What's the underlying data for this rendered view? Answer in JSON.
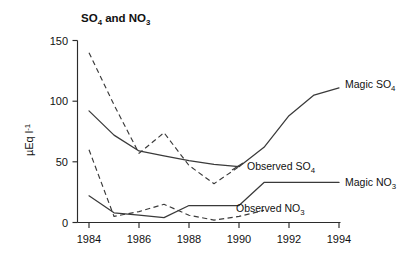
{
  "figure": {
    "title_main": "SO",
    "title_sub1": "4",
    "title_mid": " and NO",
    "title_sub2": "3",
    "title_plain": "SO4 and NO3",
    "background_color": "#ffffff",
    "ink_color": "#3a3a3a"
  },
  "axes": {
    "y_label_main": "µEq l",
    "y_label_sup": "-1",
    "y_label_plain": "µEq l-1",
    "y_ticks": [
      "0",
      "50",
      "100",
      "150"
    ],
    "y_tick_values": [
      0,
      50,
      100,
      150
    ],
    "x_ticks": [
      "1984",
      "1986",
      "1988",
      "1990",
      "1992",
      "1994"
    ],
    "x_tick_values": [
      1984,
      1986,
      1988,
      1990,
      1992,
      1994
    ],
    "x_label": ""
  },
  "series_labels": {
    "magic_so4": {
      "text": "Magic SO",
      "sub": "4",
      "plain": "Magic SO4"
    },
    "observed_so4": {
      "text": "Observed SO",
      "sub": "4",
      "plain": "Observed SO4"
    },
    "magic_no3": {
      "text": "Magic NO",
      "sub": "3",
      "plain": "Magic NO3"
    },
    "observed_no3": {
      "text": "Observed NO",
      "sub": "3",
      "plain": "Observed NO3"
    }
  },
  "chart_data": {
    "type": "line",
    "title": "SO4 and NO3",
    "xlabel": "",
    "ylabel": "µEq l-1",
    "xlim": [
      1983.6,
      1994.6
    ],
    "ylim": [
      0,
      150
    ],
    "yticks": [
      0,
      50,
      100,
      150
    ],
    "xticks": [
      1984,
      1986,
      1988,
      1990,
      1992,
      1994
    ],
    "grid": false,
    "legend": "inline-right-annotations",
    "series": [
      {
        "name": "Magic SO4",
        "style": "solid",
        "color": "#3a3a3a",
        "x": [
          1984,
          1985,
          1986,
          1987,
          1988,
          1989,
          1990,
          1991,
          1992,
          1993,
          1994
        ],
        "values": [
          92,
          72,
          59,
          55,
          51,
          48,
          46,
          62,
          88,
          105,
          111
        ]
      },
      {
        "name": "Observed SO4",
        "style": "dashed",
        "color": "#3a3a3a",
        "x": [
          1984,
          1985,
          1986,
          1987,
          1988,
          1989,
          1990
        ],
        "values": [
          140,
          97,
          57,
          74,
          47,
          32,
          46
        ]
      },
      {
        "name": "Magic NO3",
        "style": "solid",
        "color": "#3a3a3a",
        "x": [
          1984,
          1985,
          1986,
          1987,
          1988,
          1989,
          1990,
          1991,
          1992,
          1993,
          1994
        ],
        "values": [
          22,
          8,
          6,
          4,
          14,
          14,
          14,
          33,
          33,
          33,
          33
        ]
      },
      {
        "name": "Observed NO3",
        "style": "dashed",
        "color": "#3a3a3a",
        "x": [
          1984,
          1985,
          1986,
          1987,
          1988,
          1989,
          1990,
          1991
        ],
        "values": [
          60,
          5,
          9,
          15,
          6,
          2,
          5,
          10
        ]
      }
    ],
    "annotations": [
      {
        "label": "Magic SO4",
        "x": 1994.3,
        "y": 111,
        "placement": "right"
      },
      {
        "label": "Observed SO4",
        "x": 1990.3,
        "y": 44,
        "placement": "right"
      },
      {
        "label": "Magic NO3",
        "x": 1994.3,
        "y": 33,
        "placement": "right"
      },
      {
        "label": "Observed NO3",
        "x": 1990.3,
        "y": 11,
        "placement": "right"
      }
    ]
  }
}
